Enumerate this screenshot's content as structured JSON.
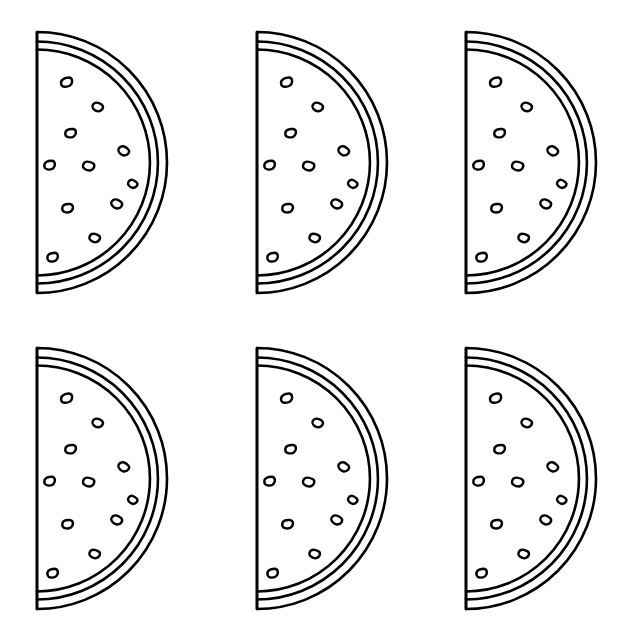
{
  "page": {
    "kind": "line-art-coloring-page",
    "background_color": "#ffffff",
    "stroke_color": "#000000",
    "fill_color": "#ffffff",
    "width": 628,
    "height": 642
  },
  "grid": {
    "rows": 2,
    "columns": 3,
    "total_items": 6,
    "column_x": [
      37,
      257,
      466
    ],
    "row_y": [
      32,
      348
    ]
  },
  "slice_geometry": {
    "flat_edge_x": 0,
    "top_y": 0,
    "bottom_y": 261,
    "center_y": 130.5,
    "radius_outer": 130,
    "radius_mid": 121,
    "radius_inner": 113,
    "stroke_width_outline": 2.6,
    "stroke_width_seed": 2.4
  },
  "seeds": {
    "count": 11,
    "shape": "teardrop-oval-outline",
    "positions": [
      {
        "cx": 30,
        "cy": 50,
        "rx": 6.2,
        "ry": 4.6,
        "rot": -18
      },
      {
        "cx": 61,
        "cy": 75,
        "rx": 5.6,
        "ry": 4.4,
        "rot": 22
      },
      {
        "cx": 34,
        "cy": 101,
        "rx": 5.8,
        "ry": 4.4,
        "rot": -8
      },
      {
        "cx": 87,
        "cy": 119,
        "rx": 5.8,
        "ry": 4.5,
        "rot": 32
      },
      {
        "cx": 13,
        "cy": 133,
        "rx": 5.8,
        "ry": 4.6,
        "rot": -12
      },
      {
        "cx": 52,
        "cy": 134,
        "rx": 6.0,
        "ry": 4.6,
        "rot": 14
      },
      {
        "cx": 31,
        "cy": 176,
        "rx": 5.8,
        "ry": 4.5,
        "rot": -6
      },
      {
        "cx": 80,
        "cy": 172,
        "rx": 5.8,
        "ry": 4.5,
        "rot": 26
      },
      {
        "cx": 58,
        "cy": 206,
        "rx": 5.6,
        "ry": 4.4,
        "rot": 18
      },
      {
        "cx": 16,
        "cy": 225,
        "rx": 5.8,
        "ry": 4.5,
        "rot": -16
      },
      {
        "cx": 96,
        "cy": 152,
        "rx": 5.0,
        "ry": 4.0,
        "rot": 30
      }
    ]
  },
  "slices": [
    {
      "id": "slice-1",
      "row": 1,
      "column": 1,
      "x": 37,
      "y": 32,
      "label": "watermelon-slice-top-left"
    },
    {
      "id": "slice-2",
      "row": 1,
      "column": 2,
      "x": 257,
      "y": 32,
      "label": "watermelon-slice-top-center"
    },
    {
      "id": "slice-3",
      "row": 1,
      "column": 3,
      "x": 466,
      "y": 32,
      "label": "watermelon-slice-top-right"
    },
    {
      "id": "slice-4",
      "row": 2,
      "column": 1,
      "x": 37,
      "y": 348,
      "label": "watermelon-slice-bottom-left"
    },
    {
      "id": "slice-5",
      "row": 2,
      "column": 2,
      "x": 257,
      "y": 348,
      "label": "watermelon-slice-bottom-center"
    },
    {
      "id": "slice-6",
      "row": 2,
      "column": 3,
      "x": 466,
      "y": 348,
      "label": "watermelon-slice-bottom-right"
    }
  ]
}
